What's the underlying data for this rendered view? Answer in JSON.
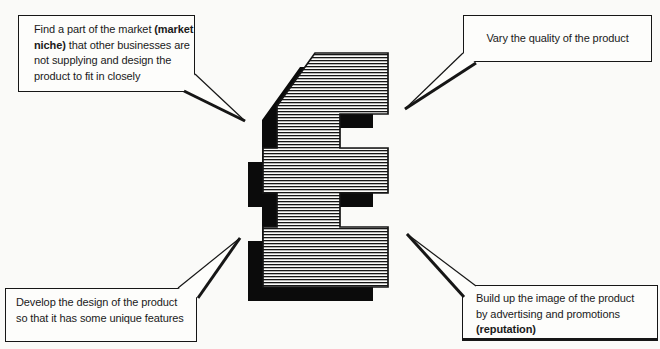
{
  "colors": {
    "ink": "#161616",
    "paper": "#fafaf8",
    "box_background": "#fdfdfb",
    "symbol_shadow": "#0b0b0b"
  },
  "symbol": {
    "name": "pound-sterling-sign",
    "style": "block pound sign filled with fine horizontal hatching, solid black drop shadow offset down-left"
  },
  "callouts": {
    "top_left": {
      "l1a": "Find a part of the market ",
      "l1b": "(market",
      "l2a": "niche)",
      "l2b": " that other businesses are",
      "l3": "not supplying and design the",
      "l4": "product to fit in closely"
    },
    "top_right": {
      "l1": "Vary the quality of the product"
    },
    "bottom_left": {
      "l1": "Develop the design of the product",
      "l2": "so that it has some unique features"
    },
    "bottom_right": {
      "l1": "Build up the image of the product",
      "l2": "by advertising and promotions",
      "l3": "(reputation)"
    }
  }
}
